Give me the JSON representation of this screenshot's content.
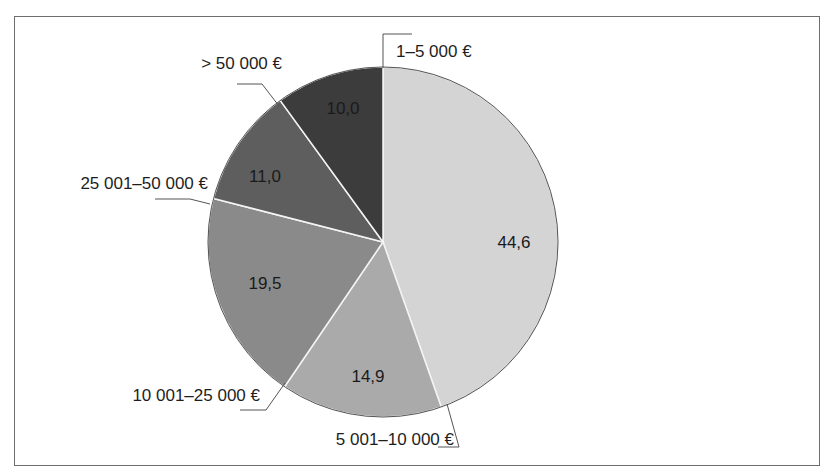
{
  "chart_data": {
    "type": "pie",
    "title": "",
    "unit": "%",
    "start_angle_deg": 0,
    "direction": "clockwise",
    "categories": [
      "1–5 000 €",
      "5 001–10 000 €",
      "10 001–25 000 €",
      "25 001–50 000 €",
      ">50 000 €"
    ],
    "values": [
      44.6,
      14.9,
      19.5,
      11.0,
      10.0
    ],
    "value_labels": [
      "44,6",
      "14,9",
      "19,5",
      "11,0",
      "10,0"
    ],
    "colors": [
      "#d4d4d4",
      "#aaaaaa",
      "#8a8a8a",
      "#5e5e5e",
      "#3c3c3c"
    ],
    "legend": "none (leader-line labels)"
  },
  "labels": {
    "s0": "1–5 000 €",
    "s1": "5 001–10 000 €",
    "s2": "10 001–25 000 €",
    "s3": "25 001–50 000 €",
    "s4": "> 50 000 €"
  },
  "values": {
    "s0": "44,6",
    "s1": "14,9",
    "s2": "19,5",
    "s3": "11,0",
    "s4": "10,0"
  }
}
